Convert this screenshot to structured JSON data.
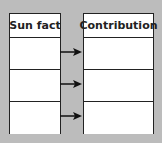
{
  "diagram": {
    "background_color": "#bcbcbc",
    "left_table": {
      "header": "Sun fact",
      "rows": [
        "",
        "",
        ""
      ]
    },
    "right_table": {
      "header": "Contribution",
      "rows": [
        "",
        "",
        ""
      ]
    },
    "arrows": [
      {
        "from": "left_table.rows.0",
        "to": "right_table.rows.0",
        "direction": "right"
      },
      {
        "from": "left_table.rows.1",
        "to": "right_table.rows.1",
        "direction": "right"
      },
      {
        "from": "left_table.rows.2",
        "to": "right_table.rows.2",
        "direction": "right"
      }
    ]
  }
}
